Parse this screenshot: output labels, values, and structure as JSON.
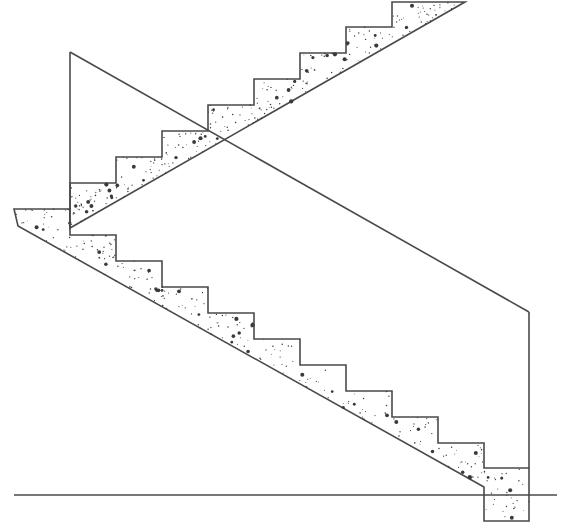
{
  "diagram": {
    "type": "architectural-section",
    "colors": {
      "line": "#4a4a4a",
      "background": "#ffffff",
      "aggregate": "#3a3a3a"
    },
    "elements": {
      "ground_line": {
        "points": [
          [
            14,
            495
          ],
          [
            557,
            495
          ]
        ]
      },
      "headroom_diagonal": {
        "points": [
          [
            70,
            52
          ],
          [
            529,
            312
          ]
        ]
      },
      "left_wall": {
        "points": [
          [
            70,
            52
          ],
          [
            70,
            228
          ]
        ]
      },
      "right_wall": {
        "points": [
          [
            529,
            312
          ],
          [
            529,
            468
          ]
        ]
      },
      "upper_flight": {
        "outline": [
          [
            70,
            183
          ],
          [
            116,
            183
          ],
          [
            116,
            157
          ],
          [
            162,
            157
          ],
          [
            162,
            131
          ],
          [
            208,
            131
          ],
          [
            208,
            105
          ],
          [
            254,
            105
          ],
          [
            254,
            79
          ],
          [
            300,
            79
          ],
          [
            300,
            53
          ],
          [
            346,
            53
          ],
          [
            346,
            27
          ],
          [
            392,
            27
          ],
          [
            392,
            2
          ],
          [
            465,
            2
          ],
          [
            70,
            228
          ]
        ]
      },
      "landing_slab": {
        "outline": [
          [
            14,
            209
          ],
          [
            70,
            209
          ],
          [
            70,
            235
          ],
          [
            116,
            235
          ],
          [
            116,
            261
          ],
          [
            162,
            261
          ],
          [
            162,
            287
          ],
          [
            208,
            287
          ],
          [
            208,
            313
          ],
          [
            254,
            313
          ],
          [
            254,
            339
          ],
          [
            300,
            339
          ],
          [
            300,
            365
          ],
          [
            346,
            365
          ],
          [
            346,
            391
          ],
          [
            392,
            391
          ],
          [
            392,
            417
          ],
          [
            438,
            417
          ],
          [
            438,
            443
          ],
          [
            484,
            443
          ],
          [
            484,
            468
          ],
          [
            529,
            468
          ],
          [
            529,
            521
          ],
          [
            484,
            521
          ],
          [
            484,
            487
          ],
          [
            18,
            226
          ]
        ]
      }
    },
    "labels": []
  }
}
